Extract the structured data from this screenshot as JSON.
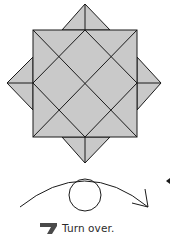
{
  "diagram": {
    "paper_color": "#c9c9c9",
    "line_color": "#1a1a1a",
    "background": "#ffffff",
    "symbols": {
      "turn_over": "turn-over-arrow-icon"
    }
  },
  "caption": {
    "step_mark_color": "#4a4a4a",
    "text": "Turn over."
  }
}
